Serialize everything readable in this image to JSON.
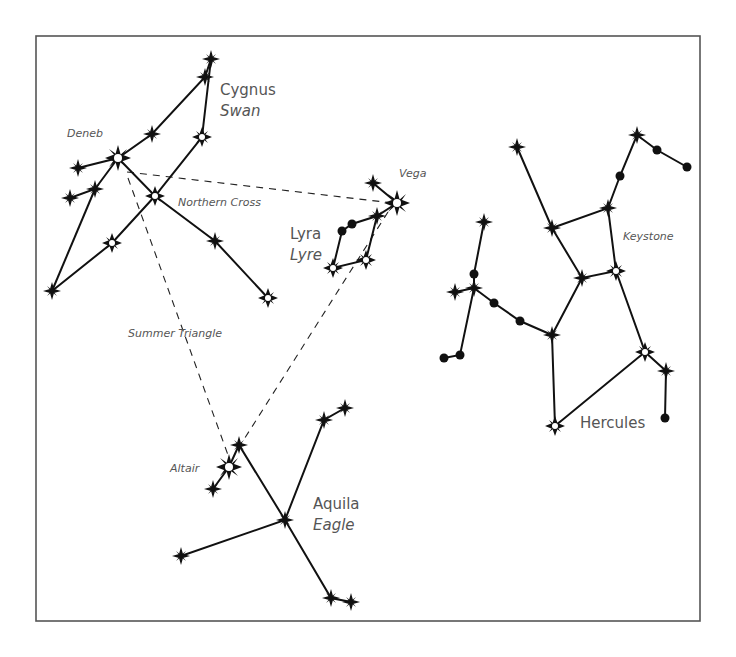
{
  "diagram": {
    "labels": {
      "cygnus": "Cygnus",
      "swan": "Swan",
      "deneb": "Deneb",
      "northern_cross": "Northern Cross",
      "vega": "Vega",
      "lyra": "Lyra",
      "lyre": "Lyre",
      "keystone": "Keystone",
      "summer_triangle": "Summer Triangle",
      "altair": "Altair",
      "aquila": "Aquila",
      "eagle": "Eagle",
      "hercules": "Hercules"
    },
    "colors": {
      "line": "#111111",
      "label": "#555555",
      "frame": "#555555",
      "background": "#ffffff"
    }
  }
}
